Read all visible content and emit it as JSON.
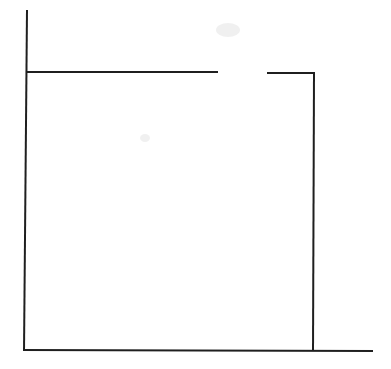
{
  "diagram": {
    "type": "line-sketch",
    "stroke_color": "#1f1f1f",
    "stroke_width": 2,
    "background": "#ffffff",
    "lines": [
      {
        "id": "left-vertical",
        "x1": 27,
        "y1": 10,
        "x2": 24,
        "y2": 351
      },
      {
        "id": "top-left-segment",
        "x1": 27,
        "y1": 72,
        "x2": 218,
        "y2": 72
      },
      {
        "id": "top-right-segment",
        "x1": 267,
        "y1": 73,
        "x2": 315,
        "y2": 73
      },
      {
        "id": "right-vertical",
        "x1": 314,
        "y1": 73,
        "x2": 313,
        "y2": 351
      },
      {
        "id": "bottom-horizontal",
        "x1": 23,
        "y1": 350,
        "x2": 373,
        "y2": 351
      }
    ],
    "gap": {
      "x_start": 218,
      "x_end": 267,
      "y": 72
    }
  }
}
